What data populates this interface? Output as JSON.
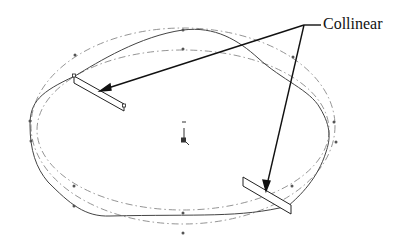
{
  "diagram": {
    "annotation_label": "Collinear",
    "colors": {
      "background": "#ffffff",
      "spline": "#333333",
      "construction": "#777777",
      "leader": "#111111",
      "handle": "#222222"
    },
    "elements": [
      "closed spline curve",
      "outer dash-dot construction ellipse",
      "inner dash-dot construction ellipse",
      "upper-left tangent handle",
      "lower-right tangent handle",
      "origin marker",
      "two leader arrows from label"
    ]
  }
}
